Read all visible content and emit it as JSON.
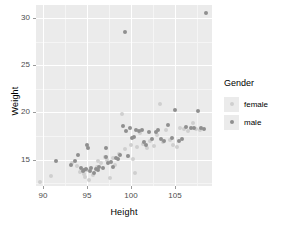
{
  "chart_data": {
    "type": "scatter",
    "title": "",
    "xlabel": "Height",
    "ylabel": "Weight",
    "xlim": [
      89.2,
      109.2
    ],
    "ylim": [
      12.2,
      31.4
    ],
    "xticks": [
      90,
      95,
      100,
      105
    ],
    "yticks": [
      15,
      20,
      25,
      30
    ],
    "grid": true,
    "legend": {
      "title": "Gender",
      "position": "right",
      "entries": [
        {
          "label": "female",
          "color": "#cfcfcf"
        },
        {
          "label": "male",
          "color": "#8f8f8f"
        }
      ]
    },
    "series": [
      {
        "name": "female",
        "color": "#cfcfcf",
        "points": [
          [
            89.6,
            12.6
          ],
          [
            90.9,
            13.3
          ],
          [
            93.3,
            14.6
          ],
          [
            93.9,
            14.3
          ],
          [
            94.2,
            13.7
          ],
          [
            94.6,
            13.5
          ],
          [
            94.8,
            13.2
          ],
          [
            95.0,
            13.9
          ],
          [
            95.2,
            12.8
          ],
          [
            95.7,
            13.4
          ],
          [
            96.1,
            14.2
          ],
          [
            96.3,
            14.8
          ],
          [
            96.6,
            14.6
          ],
          [
            97.0,
            15.3
          ],
          [
            97.3,
            15.0
          ],
          [
            97.6,
            13.1
          ],
          [
            97.9,
            15.2
          ],
          [
            98.2,
            14.4
          ],
          [
            98.6,
            15.6
          ],
          [
            99.0,
            19.8
          ],
          [
            99.3,
            16.1
          ],
          [
            99.6,
            15.4
          ],
          [
            100.0,
            16.6
          ],
          [
            100.2,
            15.1
          ],
          [
            100.4,
            13.6
          ],
          [
            100.7,
            16.3
          ],
          [
            101.0,
            17.8
          ],
          [
            101.4,
            16.7
          ],
          [
            101.8,
            16.2
          ],
          [
            102.2,
            17.0
          ],
          [
            102.6,
            16.4
          ],
          [
            103.0,
            17.6
          ],
          [
            103.3,
            20.9
          ],
          [
            103.6,
            16.9
          ],
          [
            104.0,
            18.1
          ],
          [
            104.4,
            17.1
          ],
          [
            104.8,
            16.5
          ],
          [
            105.2,
            16.3
          ],
          [
            105.6,
            18.4
          ],
          [
            106.0,
            18.2
          ],
          [
            106.5,
            18.0
          ],
          [
            107.0,
            18.9
          ],
          [
            107.4,
            18.2
          ],
          [
            107.8,
            18.1
          ]
        ]
      },
      {
        "name": "male",
        "color": "#8f8f8f",
        "points": [
          [
            91.5,
            14.9
          ],
          [
            93.2,
            14.4
          ],
          [
            93.6,
            14.9
          ],
          [
            94.0,
            15.5
          ],
          [
            94.3,
            14.1
          ],
          [
            94.5,
            13.8
          ],
          [
            94.7,
            13.9
          ],
          [
            94.9,
            14.0
          ],
          [
            95.0,
            16.5
          ],
          [
            95.1,
            16.2
          ],
          [
            95.3,
            13.8
          ],
          [
            95.5,
            14.1
          ],
          [
            95.8,
            13.6
          ],
          [
            96.0,
            14.0
          ],
          [
            96.2,
            13.9
          ],
          [
            96.4,
            14.2
          ],
          [
            96.8,
            14.1
          ],
          [
            97.1,
            16.2
          ],
          [
            97.2,
            15.3
          ],
          [
            97.4,
            14.6
          ],
          [
            97.7,
            14.7
          ],
          [
            98.0,
            14.2
          ],
          [
            98.3,
            15.2
          ],
          [
            98.5,
            15.1
          ],
          [
            98.8,
            15.5
          ],
          [
            99.1,
            18.6
          ],
          [
            99.4,
            18.0
          ],
          [
            99.7,
            15.4
          ],
          [
            99.9,
            18.3
          ],
          [
            100.1,
            17.3
          ],
          [
            100.3,
            17.4
          ],
          [
            100.6,
            18.1
          ],
          [
            100.9,
            18.0
          ],
          [
            101.2,
            18.1
          ],
          [
            101.5,
            16.9
          ],
          [
            101.7,
            16.6
          ],
          [
            102.0,
            17.9
          ],
          [
            102.4,
            17.2
          ],
          [
            102.8,
            17.9
          ],
          [
            103.1,
            18.1
          ],
          [
            103.4,
            17.2
          ],
          [
            103.8,
            17.0
          ],
          [
            104.2,
            18.7
          ],
          [
            104.6,
            17.3
          ],
          [
            105.0,
            20.3
          ],
          [
            105.4,
            17.0
          ],
          [
            105.8,
            17.2
          ],
          [
            106.3,
            18.5
          ],
          [
            106.8,
            18.3
          ],
          [
            107.2,
            18.4
          ],
          [
            107.6,
            20.2
          ],
          [
            108.0,
            18.3
          ],
          [
            108.3,
            18.2
          ],
          [
            99.3,
            28.5
          ],
          [
            108.5,
            30.5
          ]
        ]
      }
    ]
  }
}
